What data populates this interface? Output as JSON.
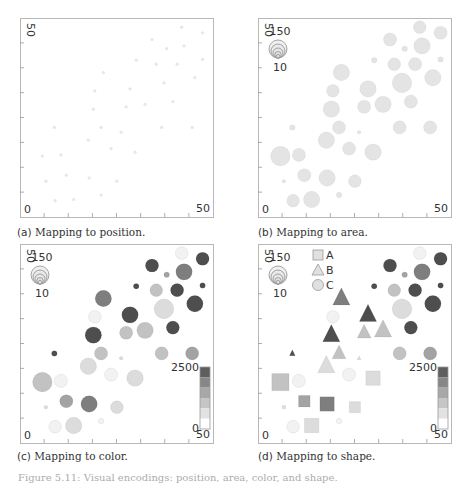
{
  "figure": {
    "footer_text": "Figure 5.11: Visual encodings: position, area, color, and shape."
  },
  "panels": [
    {
      "id": "a",
      "tag": "(a)",
      "caption": "Mapping to position.",
      "encoding": "position"
    },
    {
      "id": "b",
      "tag": "(b)",
      "caption": "Mapping to area.",
      "encoding": "area"
    },
    {
      "id": "c",
      "tag": "(c)",
      "caption": "Mapping to color.",
      "encoding": "color"
    },
    {
      "id": "d",
      "tag": "(d)",
      "caption": "Mapping to shape.",
      "encoding": "shape"
    }
  ],
  "axis": {
    "min_label": "0",
    "max_label": "50",
    "y_max_label": "50",
    "ticks": 8
  },
  "size_legend": {
    "max_label": "150",
    "min_label": "10"
  },
  "color_legend": {
    "max_label": "2500",
    "min_label": "0",
    "steps": [
      "#ffffff",
      "#e2e2e2",
      "#c6c6c6",
      "#a8a8a8",
      "#878787",
      "#5e5e5e"
    ]
  },
  "shape_legend": [
    {
      "label": "A",
      "shape": "square"
    },
    {
      "label": "B",
      "shape": "triangle"
    },
    {
      "label": "C",
      "shape": "circle"
    }
  ],
  "colors": {
    "point_a": "#e6e6e6",
    "frame": "#b8b8b8",
    "tick": "#999999",
    "text": "#333333"
  },
  "chart_data": {
    "type": "scatter",
    "xlabel": "",
    "ylabel": "",
    "xlim": [
      0,
      50
    ],
    "ylim": [
      0,
      50
    ],
    "grid": false,
    "size_range": [
      10,
      150
    ],
    "value_range": [
      0,
      2500
    ],
    "categories": [
      "A",
      "B",
      "C"
    ],
    "points": [
      {
        "x": 41.9,
        "y": 47.7,
        "size": 55,
        "value": 150,
        "cat": "C"
      },
      {
        "x": 47.3,
        "y": 46.3,
        "size": 60,
        "value": 2300,
        "cat": "C"
      },
      {
        "x": 34.2,
        "y": 44.6,
        "size": 60,
        "value": 2300,
        "cat": "C"
      },
      {
        "x": 38.0,
        "y": 42.3,
        "size": 12,
        "value": 1500,
        "cat": "C"
      },
      {
        "x": 42.5,
        "y": 43.0,
        "size": 100,
        "value": 1800,
        "cat": "C"
      },
      {
        "x": 30.1,
        "y": 39.4,
        "size": 12,
        "value": 2300,
        "cat": "C"
      },
      {
        "x": 35.3,
        "y": 38.4,
        "size": 55,
        "value": 1100,
        "cat": "C"
      },
      {
        "x": 40.7,
        "y": 38.4,
        "size": 60,
        "value": 2300,
        "cat": "C"
      },
      {
        "x": 47.3,
        "y": 39.6,
        "size": 12,
        "value": 2300,
        "cat": "C"
      },
      {
        "x": 21.6,
        "y": 36.3,
        "size": 100,
        "value": 1800,
        "cat": "B"
      },
      {
        "x": 45.3,
        "y": 35.0,
        "size": 100,
        "value": 2300,
        "cat": "C"
      },
      {
        "x": 37.3,
        "y": 33.7,
        "size": 150,
        "value": 600,
        "cat": "C"
      },
      {
        "x": 19.4,
        "y": 31.7,
        "size": 55,
        "value": 100,
        "cat": "C"
      },
      {
        "x": 28.5,
        "y": 32.2,
        "size": 100,
        "value": 2300,
        "cat": "B"
      },
      {
        "x": 39.6,
        "y": 29.0,
        "size": 60,
        "value": 2300,
        "cat": "C"
      },
      {
        "x": 32.4,
        "y": 28.3,
        "size": 100,
        "value": 1100,
        "cat": "B"
      },
      {
        "x": 19.0,
        "y": 27.1,
        "size": 100,
        "value": 2300,
        "cat": "B"
      },
      {
        "x": 27.5,
        "y": 27.7,
        "size": 60,
        "value": 1100,
        "cat": "B"
      },
      {
        "x": 8.9,
        "y": 22.5,
        "size": 12,
        "value": 2300,
        "cat": "B"
      },
      {
        "x": 21.0,
        "y": 22.5,
        "size": 60,
        "value": 1100,
        "cat": "B"
      },
      {
        "x": 36.7,
        "y": 22.5,
        "size": 60,
        "value": 1100,
        "cat": "C"
      },
      {
        "x": 44.6,
        "y": 22.5,
        "size": 60,
        "value": 1500,
        "cat": "C"
      },
      {
        "x": 26.2,
        "y": 21.3,
        "size": 10,
        "value": 600,
        "cat": "B"
      },
      {
        "x": 17.7,
        "y": 19.3,
        "size": 100,
        "value": 600,
        "cat": "B"
      },
      {
        "x": 23.6,
        "y": 17.2,
        "size": 60,
        "value": 100,
        "cat": "C"
      },
      {
        "x": 29.8,
        "y": 16.3,
        "size": 100,
        "value": 600,
        "cat": "A"
      },
      {
        "x": 5.8,
        "y": 15.3,
        "size": 150,
        "value": 1100,
        "cat": "A"
      },
      {
        "x": 10.6,
        "y": 15.6,
        "size": 60,
        "value": 100,
        "cat": "C"
      },
      {
        "x": 6.7,
        "y": 9.0,
        "size": 10,
        "value": 600,
        "cat": "A"
      },
      {
        "x": 12.0,
        "y": 10.5,
        "size": 60,
        "value": 1500,
        "cat": "A"
      },
      {
        "x": 17.9,
        "y": 9.8,
        "size": 100,
        "value": 1800,
        "cat": "A"
      },
      {
        "x": 25.1,
        "y": 9.0,
        "size": 55,
        "value": 600,
        "cat": "A"
      },
      {
        "x": 9.1,
        "y": 4.1,
        "size": 55,
        "value": 100,
        "cat": "C"
      },
      {
        "x": 13.9,
        "y": 4.4,
        "size": 100,
        "value": 600,
        "cat": "A"
      },
      {
        "x": 21.0,
        "y": 5.5,
        "size": 12,
        "value": 100,
        "cat": "C"
      }
    ]
  }
}
